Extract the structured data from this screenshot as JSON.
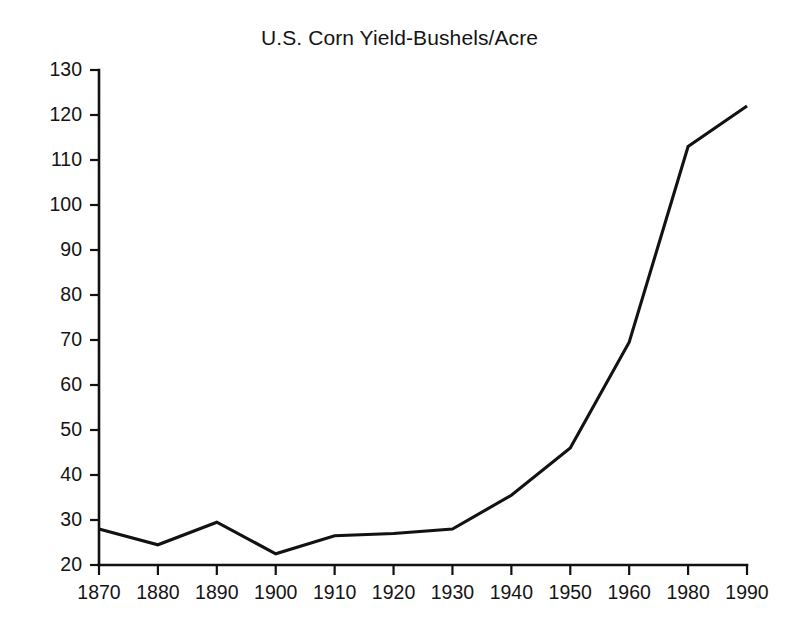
{
  "chart_data": {
    "type": "line",
    "title": "U.S. Corn Yield-Bushels/Acre",
    "xlabel": "",
    "ylabel": "",
    "categories": [
      "1870",
      "1880",
      "1890",
      "1900",
      "1910",
      "1920",
      "1930",
      "1940",
      "1950",
      "1960",
      "1980",
      "1990"
    ],
    "values": [
      28,
      24.5,
      29.5,
      22.5,
      26.5,
      27,
      28,
      35.5,
      46,
      69.5,
      113,
      122
    ],
    "series": [
      {
        "name": "U.S. Corn Yield",
        "values": [
          28,
          24.5,
          29.5,
          22.5,
          26.5,
          27,
          28,
          35.5,
          46,
          69.5,
          113,
          122
        ]
      }
    ],
    "ylim": [
      20,
      130
    ],
    "xlim": [
      0,
      11
    ],
    "ytick_labels": [
      "130",
      "120",
      "110",
      "100",
      "90",
      "80",
      "70",
      "60",
      "50",
      "40",
      "30",
      "20"
    ],
    "ytick_values": [
      130,
      120,
      110,
      100,
      90,
      80,
      70,
      60,
      50,
      40,
      30,
      20
    ],
    "xtick_labels": [
      "1870",
      "1880",
      "1890",
      "1900",
      "1910",
      "1920",
      "1930",
      "1940",
      "1950",
      "1960",
      "1980",
      "1990"
    ],
    "grid": false,
    "legend": false,
    "legend_position": "none",
    "line_color": "#121212",
    "axis_color": "#111111",
    "background_color": "#ffffff"
  }
}
